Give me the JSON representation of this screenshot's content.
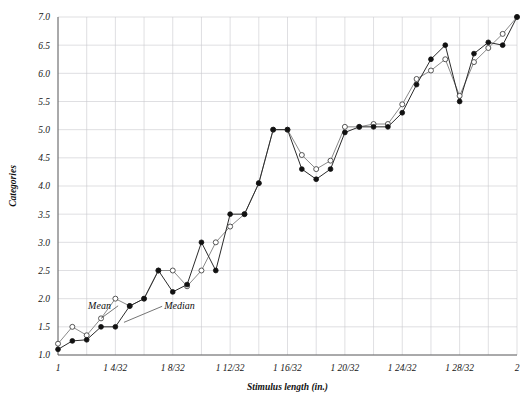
{
  "chart_data": {
    "type": "line",
    "title": "",
    "xlabel": "Stimulus length (in.)",
    "ylabel": "Categories",
    "ylim": [
      1.0,
      7.0
    ],
    "xlim": [
      0,
      32
    ],
    "grid": true,
    "legend_position": "inline-annotation",
    "ytick_labels": [
      "1.0",
      "1.5",
      "2.0",
      "2.5",
      "3.0",
      "3.5",
      "4.0",
      "4.5",
      "5.0",
      "5.5",
      "6.0",
      "6.5",
      "7.0"
    ],
    "ytick_values": [
      1.0,
      1.5,
      2.0,
      2.5,
      3.0,
      3.5,
      4.0,
      4.5,
      5.0,
      5.5,
      6.0,
      6.5,
      7.0
    ],
    "xtick_labels": [
      "1",
      "1 4/32",
      "1 8/32",
      "1 12/32",
      "1 16/32",
      "1 20/32",
      "1 24/32",
      "1 28/32",
      "2"
    ],
    "xtick_values": [
      0,
      4,
      8,
      12,
      16,
      20,
      24,
      28,
      32
    ],
    "x": [
      0,
      1,
      2,
      3,
      4,
      5,
      6,
      7,
      8,
      9,
      10,
      11,
      12,
      13,
      14,
      15,
      16,
      17,
      18,
      19,
      20,
      21,
      22,
      23,
      24,
      25,
      26,
      27,
      28,
      29,
      30,
      31,
      32
    ],
    "annotations": [
      {
        "text": "Mean",
        "x": 2.1,
        "y": 1.82
      },
      {
        "text": "Median",
        "x": 7.4,
        "y": 1.82
      }
    ],
    "series": [
      {
        "name": "Mean",
        "marker": "open-circle",
        "color": "#8a8a8a",
        "values": [
          1.2,
          1.5,
          1.35,
          1.65,
          2.0,
          1.87,
          2.0,
          2.5,
          2.5,
          2.22,
          2.5,
          3.0,
          3.28,
          3.5,
          4.05,
          5.0,
          5.0,
          4.55,
          4.3,
          4.45,
          5.05,
          5.05,
          5.1,
          5.1,
          5.45,
          5.9,
          6.05,
          6.25,
          5.6,
          6.2,
          6.45,
          6.7,
          7.0
        ]
      },
      {
        "name": "Median",
        "marker": "filled-circle",
        "color": "#2b2b2b",
        "values": [
          1.1,
          1.25,
          1.27,
          1.5,
          1.5,
          1.87,
          2.0,
          2.5,
          2.12,
          2.25,
          3.0,
          2.5,
          3.5,
          3.5,
          4.05,
          5.0,
          5.0,
          4.3,
          4.12,
          4.3,
          4.95,
          5.05,
          5.05,
          5.05,
          5.3,
          5.8,
          6.25,
          6.5,
          5.5,
          6.35,
          6.55,
          6.5,
          7.0
        ]
      }
    ]
  }
}
